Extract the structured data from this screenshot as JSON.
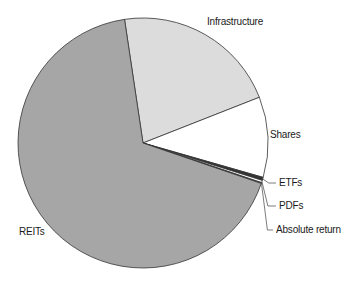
{
  "chart_data": {
    "type": "pie",
    "title": "",
    "categories": [
      "Infrastructure",
      "Shares",
      "ETFs",
      "PDFs",
      "Absolute return",
      "REITs"
    ],
    "values": [
      21.4,
      10.4,
      0.4,
      0.3,
      0.1,
      67.4
    ],
    "colors": [
      "#dcdcdc",
      "#ffffff",
      "#333333",
      "#ffffff",
      "#999999",
      "#a6a6a6"
    ],
    "start_angle_deg": -8.5,
    "direction": "clockwise",
    "legend": "none (leader-line labels)"
  },
  "labels": {
    "infrastructure": "Infrastructure",
    "shares": "Shares",
    "etfs": "ETFs",
    "pdfs": "PDFs",
    "absolute_return": "Absolute return",
    "reits": "REITs"
  }
}
